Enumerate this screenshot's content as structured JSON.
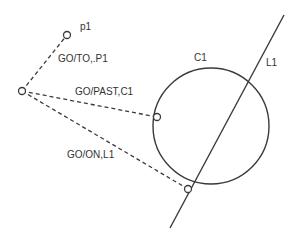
{
  "diagram": {
    "colors": {
      "stroke": "#3a3a3a",
      "text": "#333333",
      "background": "#ffffff"
    },
    "origin": {
      "x": 22,
      "y": 91
    },
    "point": {
      "label": "p1",
      "x": 67,
      "y": 35,
      "label_x": 80,
      "label_y": 30
    },
    "circle": {
      "label": "C1",
      "cx": 211,
      "cy": 126,
      "r": 58,
      "label_x": 194,
      "label_y": 61
    },
    "line": {
      "label": "L1",
      "x1": 170,
      "y1": 228,
      "x2": 284,
      "y2": 15,
      "label_x": 266,
      "label_y": 66
    },
    "paths": [
      {
        "label": "GO/TO,.P1",
        "target_x": 67,
        "target_y": 35,
        "label_x": 58,
        "label_y": 62
      },
      {
        "label": "GO/PAST,C1",
        "target_x": 157,
        "target_y": 117,
        "label_x": 75,
        "label_y": 95
      },
      {
        "label": "GO/ON,L1",
        "target_x": 188,
        "target_y": 189,
        "label_x": 67,
        "label_y": 158
      }
    ]
  }
}
